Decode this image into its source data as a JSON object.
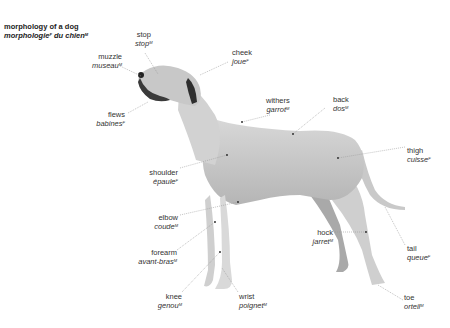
{
  "title": {
    "en": "morphology of a dog",
    "fr": "morphologie",
    "fr_gender": "F",
    "fr_rest": " du chien",
    "fr_rest_gender": "M"
  },
  "labels": [
    {
      "id": "stop",
      "en": "stop",
      "fr": "stop",
      "gender": "M"
    },
    {
      "id": "muzzle",
      "en": "muzzle",
      "fr": "museau",
      "gender": "M"
    },
    {
      "id": "cheek",
      "en": "cheek",
      "fr": "joue",
      "gender": "F"
    },
    {
      "id": "flews",
      "en": "flews",
      "fr": "babines",
      "gender": "F"
    },
    {
      "id": "withers",
      "en": "withers",
      "fr": "garrot",
      "gender": "M"
    },
    {
      "id": "back",
      "en": "back",
      "fr": "dos",
      "gender": "M"
    },
    {
      "id": "thigh",
      "en": "thigh",
      "fr": "cuisse",
      "gender": "F"
    },
    {
      "id": "shoulder",
      "en": "shoulder",
      "fr": "épaule",
      "gender": "F"
    },
    {
      "id": "elbow",
      "en": "elbow",
      "fr": "coude",
      "gender": "M"
    },
    {
      "id": "forearm",
      "en": "forearm",
      "fr": "avant-bras",
      "gender": "M"
    },
    {
      "id": "hock",
      "en": "hock",
      "fr": "jarret",
      "gender": "M"
    },
    {
      "id": "tail",
      "en": "tail",
      "fr": "queue",
      "gender": "F"
    },
    {
      "id": "knee",
      "en": "knee",
      "fr": "genou",
      "gender": "M"
    },
    {
      "id": "wrist",
      "en": "wrist",
      "fr": "poignet",
      "gender": "M"
    },
    {
      "id": "toe",
      "en": "toe",
      "fr": "orteil",
      "gender": "M"
    }
  ],
  "colors": {
    "background": "#ffffff",
    "text": "#333333",
    "leader": "#999999",
    "dog_light": "#e2e2e2",
    "dog_mid": "#bdbdbd",
    "dog_dark": "#3a3a3a"
  }
}
